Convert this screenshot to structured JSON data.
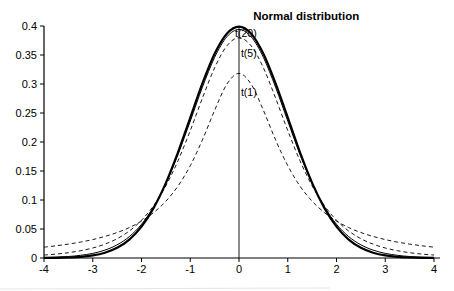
{
  "figure": {
    "background": "#ffffff",
    "ink_color": "#000000"
  },
  "chart_data": {
    "type": "line",
    "title": "Normal distribution",
    "xlabel": "",
    "ylabel": "",
    "xlim": [
      -4,
      4
    ],
    "ylim": [
      0,
      0.4
    ],
    "grid": false,
    "legend_position": "none (inline annotations)",
    "x_ticks": [
      -4,
      -3,
      -2,
      -1,
      0,
      1,
      2,
      3,
      4
    ],
    "x_tick_labels": [
      "-4",
      "-3",
      "-2",
      "-1",
      "0",
      "1",
      "2",
      "3",
      "4"
    ],
    "y_ticks": [
      0,
      0.05,
      0.1,
      0.15,
      0.2,
      0.25,
      0.3,
      0.35,
      0.4
    ],
    "y_tick_labels": [
      "0",
      "0.05",
      "0.1",
      "0.15",
      "0.2",
      "0.25",
      "0.3",
      "0.35",
      "0.4"
    ],
    "x": [
      -4,
      -3.75,
      -3.5,
      -3.25,
      -3,
      -2.75,
      -2.5,
      -2.25,
      -2,
      -1.75,
      -1.5,
      -1.25,
      -1,
      -0.75,
      -0.5,
      -0.25,
      0,
      0.25,
      0.5,
      0.75,
      1,
      1.25,
      1.5,
      1.75,
      2,
      2.25,
      2.5,
      2.75,
      3,
      3.25,
      3.5,
      3.75,
      4
    ],
    "series": [
      {
        "name": "t(1)",
        "line_style": "dashed",
        "line_width": 0.9,
        "color": "#000000",
        "values": [
          0.0187,
          0.0211,
          0.024,
          0.0275,
          0.0318,
          0.0372,
          0.0439,
          0.0525,
          0.0637,
          0.0784,
          0.0979,
          0.1242,
          0.1592,
          0.2037,
          0.2546,
          0.2996,
          0.3183,
          0.2996,
          0.2546,
          0.2037,
          0.1592,
          0.1242,
          0.0979,
          0.0784,
          0.0637,
          0.0525,
          0.0439,
          0.0372,
          0.0318,
          0.0275,
          0.024,
          0.0211,
          0.0187
        ]
      },
      {
        "name": "t(5)",
        "line_style": "dashed",
        "line_width": 0.9,
        "color": "#000000",
        "values": [
          0.0051,
          0.0068,
          0.0092,
          0.0126,
          0.0173,
          0.0239,
          0.0333,
          0.0466,
          0.0651,
          0.0905,
          0.1245,
          0.1679,
          0.2197,
          0.2757,
          0.3279,
          0.3657,
          0.3796,
          0.3657,
          0.3279,
          0.2757,
          0.2197,
          0.1679,
          0.1245,
          0.0905,
          0.0651,
          0.0466,
          0.0333,
          0.0239,
          0.0173,
          0.0126,
          0.0092,
          0.0068,
          0.0051
        ]
      },
      {
        "name": "t(20)",
        "line_style": "solid",
        "line_width": 1,
        "color": "#000000",
        "values": [
          0.0008,
          0.0015,
          0.0026,
          0.0046,
          0.008,
          0.0136,
          0.0227,
          0.0369,
          0.0581,
          0.0883,
          0.1286,
          0.1788,
          0.2361,
          0.2945,
          0.3458,
          0.3813,
          0.394,
          0.3813,
          0.3458,
          0.2945,
          0.2361,
          0.1788,
          0.1286,
          0.0883,
          0.0581,
          0.0369,
          0.0227,
          0.0136,
          0.008,
          0.0046,
          0.0026,
          0.0015,
          0.0008
        ]
      },
      {
        "name": "Normal distribution",
        "line_style": "solid",
        "line_width": 2.2,
        "color": "#000000",
        "values": [
          0.0001,
          0.0004,
          0.0009,
          0.002,
          0.0044,
          0.0091,
          0.0175,
          0.0317,
          0.054,
          0.0863,
          0.1295,
          0.1826,
          0.242,
          0.3011,
          0.3521,
          0.3867,
          0.3989,
          0.3867,
          0.3521,
          0.3011,
          0.242,
          0.1826,
          0.1295,
          0.0863,
          0.054,
          0.0317,
          0.0175,
          0.0091,
          0.0044,
          0.002,
          0.0009,
          0.0004,
          0.0001
        ]
      }
    ],
    "reference_line": {
      "x": 0,
      "from_y": 0,
      "to_y": 0.3989
    },
    "annotations": [
      {
        "text": "Normal distribution",
        "x": 0.29,
        "y": 0.417,
        "anchor": "start",
        "bold": true
      },
      {
        "text": "t(20)",
        "x": -0.08,
        "y": 0.388,
        "anchor": "start",
        "bold": false
      },
      {
        "text": "t(5)",
        "x": 0.04,
        "y": 0.353,
        "anchor": "start",
        "bold": false
      },
      {
        "text": "t(1)",
        "x": 0.04,
        "y": 0.286,
        "anchor": "start",
        "bold": false
      }
    ]
  }
}
